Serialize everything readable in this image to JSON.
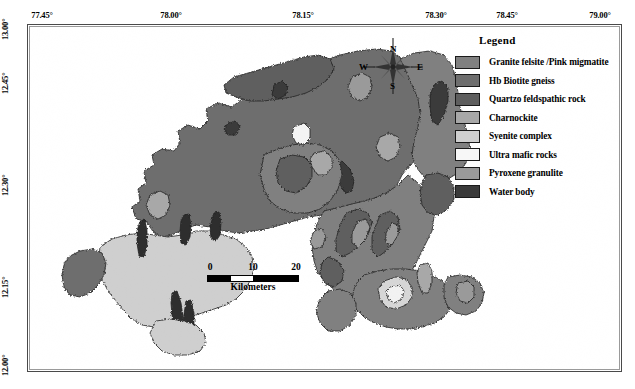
{
  "figure": {
    "type": "geological-map",
    "frame": {
      "x": 27,
      "y": 24,
      "width": 595,
      "height": 348
    }
  },
  "axes": {
    "top": {
      "labels": [
        "77.45°",
        "78.00°",
        "78.15°",
        "78.30°",
        "78.45°",
        "79.00°"
      ],
      "positions_px": [
        38,
        171,
        303,
        436,
        507,
        600
      ]
    },
    "left": {
      "labels": [
        "13.00°",
        "12.45°",
        "12.30°",
        "12.15°",
        "12.00°"
      ],
      "positions_px": [
        30,
        84,
        186,
        288,
        366
      ]
    }
  },
  "legend": {
    "title": "Legend",
    "items": [
      {
        "label": "Granite felsite /Pink migmatite",
        "color": "#808080"
      },
      {
        "label": "Hb Biotite gneiss",
        "color": "#6e6e6e"
      },
      {
        "label": "Quartzo feldspathic rock",
        "color": "#5e5e5e"
      },
      {
        "label": "Charnockite",
        "color": "#a8a8a8"
      },
      {
        "label": "Syenite complex",
        "color": "#cfcfcf"
      },
      {
        "label": "Ultra mafic rocks",
        "color": "#f2f2f2"
      },
      {
        "label": "Pyroxene granulite",
        "color": "#9a9a9a"
      },
      {
        "label": "Water body",
        "color": "#3a3a3a"
      }
    ]
  },
  "scale_bar": {
    "ticks": [
      "0",
      "10",
      "20"
    ],
    "unit_label": "Kilometers",
    "max_km": 20
  },
  "compass": {
    "north": "N",
    "east": "E",
    "south": "S",
    "west": "W"
  }
}
